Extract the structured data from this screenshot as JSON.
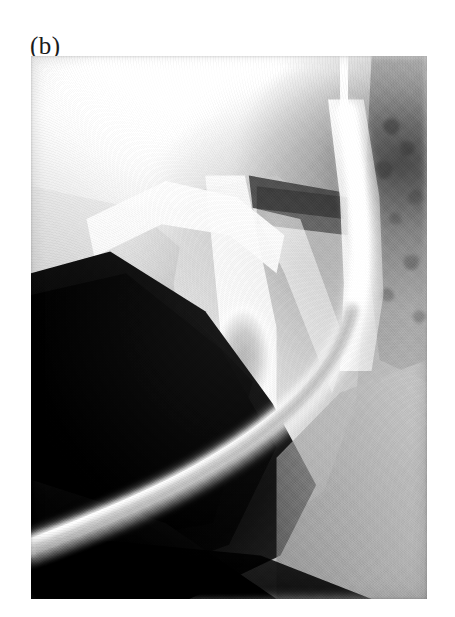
{
  "figure": {
    "panel_label": "(b)",
    "modality": "radiograph",
    "view": "lateral",
    "region": "temporomandibular joint / mandibular ramus",
    "orientation": "anterior-left",
    "background_color": "#ffffff",
    "plate": {
      "left": 31,
      "top": 56,
      "width": 396,
      "height": 543,
      "tone_light": "#ffffff",
      "tone_mid": "#9a9a9a",
      "tone_dark": "#000000"
    },
    "features": [
      {
        "name": "upper-bright-field",
        "label": "radiolucent upper field",
        "tone": "#ffffff"
      },
      {
        "name": "dark-soft-tissue-triangle",
        "label": "dark soft-tissue / air shadow, left mid-field",
        "tone": "#050505"
      },
      {
        "name": "articular-eminence-arch",
        "label": "bright articular eminence arch",
        "tone": "#fdfdfd"
      },
      {
        "name": "mandibular-ramus",
        "label": "mandibular ramus body",
        "tone": "#d8d8d8"
      },
      {
        "name": "joint-air-band",
        "label": "dark radiolucent joint band",
        "tone": "#3c3c3c"
      },
      {
        "name": "oval-lucency",
        "label": "central oval lucency",
        "tone": "#a5a5a5"
      },
      {
        "name": "contrast-band",
        "label": "bright contrast-filled S-curved band",
        "tone": "#ffffff"
      },
      {
        "name": "mastoid-bone",
        "label": "mottled temporal / mastoid bone, right margin",
        "tone": "#a8a8a8"
      },
      {
        "name": "lower-right-soft-tissue",
        "label": "lower right soft-tissue gradient",
        "tone": "#c2c2c2"
      }
    ]
  }
}
